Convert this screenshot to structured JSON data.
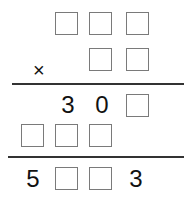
{
  "puzzle": {
    "operator": "×",
    "multiplicand": [
      "",
      "",
      ""
    ],
    "multiplier": [
      "",
      ""
    ],
    "partial1": [
      "3",
      "0",
      ""
    ],
    "partial2": [
      "",
      "",
      ""
    ],
    "result": [
      "5",
      "",
      "",
      "3"
    ]
  }
}
